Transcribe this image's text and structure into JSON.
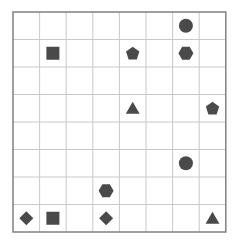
{
  "grid": {
    "rows": 8,
    "cols": 8,
    "origin": [
      13,
      12
    ],
    "cell_width": 26.6,
    "cell_height": 27.5,
    "line_color": "#c8c8c8",
    "border_color": "#808080",
    "shape_color": "#4a4a4a"
  },
  "shapes": [
    {
      "type": "circle",
      "row": 0,
      "col": 6
    },
    {
      "type": "square",
      "row": 1,
      "col": 1
    },
    {
      "type": "pentagon",
      "row": 1,
      "col": 4
    },
    {
      "type": "hexagon",
      "row": 1,
      "col": 6
    },
    {
      "type": "triangle",
      "row": 3,
      "col": 4
    },
    {
      "type": "pentagon",
      "row": 3,
      "col": 7
    },
    {
      "type": "circle",
      "row": 5,
      "col": 6
    },
    {
      "type": "hexagon",
      "row": 6,
      "col": 3
    },
    {
      "type": "diamond",
      "row": 7,
      "col": 0
    },
    {
      "type": "square",
      "row": 7,
      "col": 1
    },
    {
      "type": "diamond",
      "row": 7,
      "col": 3
    },
    {
      "type": "triangle",
      "row": 7,
      "col": 7
    }
  ]
}
